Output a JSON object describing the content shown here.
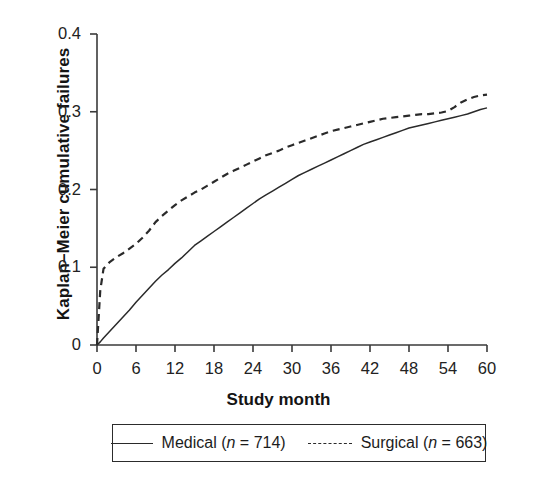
{
  "chart_data": {
    "type": "line",
    "title": "",
    "xlabel": "Study month",
    "ylabel": "Kaplan–Meier cumulative failures",
    "xlim": [
      0,
      60
    ],
    "ylim": [
      0,
      0.4
    ],
    "xticks": [
      "0",
      "6",
      "12",
      "18",
      "24",
      "30",
      "36",
      "42",
      "48",
      "54",
      "60"
    ],
    "yticks": [
      "0",
      "0.1",
      "0.2",
      "0.3",
      "0.4"
    ],
    "xtick_values": [
      0,
      6,
      12,
      18,
      24,
      30,
      36,
      42,
      48,
      54,
      60
    ],
    "ytick_values": [
      0,
      0.1,
      0.2,
      0.3,
      0.4
    ],
    "grid": false,
    "legend_position": "below-axis",
    "x": [
      0,
      0.5,
      1,
      2,
      3,
      4,
      5,
      6,
      7,
      8,
      9,
      10,
      11,
      12,
      13,
      14,
      15,
      16,
      17,
      18,
      19,
      20,
      21,
      22,
      23,
      24,
      25,
      26,
      27,
      28,
      29,
      30,
      31,
      32,
      33,
      34,
      35,
      36,
      37,
      38,
      39,
      40,
      41,
      42,
      43,
      44,
      45,
      46,
      47,
      48,
      49,
      50,
      51,
      52,
      53,
      54,
      55,
      56,
      57,
      58,
      59,
      60
    ],
    "series": [
      {
        "name": "Medical (n = 714)",
        "label_plain": "Medical",
        "n": 714,
        "style": "solid",
        "color": "#2a2a2a",
        "values": [
          0,
          0.004,
          0.009,
          0.018,
          0.027,
          0.036,
          0.045,
          0.055,
          0.064,
          0.073,
          0.082,
          0.09,
          0.097,
          0.105,
          0.112,
          0.12,
          0.128,
          0.134,
          0.14,
          0.146,
          0.152,
          0.158,
          0.164,
          0.17,
          0.176,
          0.182,
          0.188,
          0.193,
          0.198,
          0.203,
          0.208,
          0.213,
          0.218,
          0.222,
          0.226,
          0.23,
          0.234,
          0.238,
          0.242,
          0.246,
          0.25,
          0.254,
          0.258,
          0.261,
          0.264,
          0.267,
          0.27,
          0.273,
          0.276,
          0.279,
          0.281,
          0.283,
          0.285,
          0.287,
          0.289,
          0.291,
          0.293,
          0.295,
          0.297,
          0.3,
          0.303,
          0.305
        ]
      },
      {
        "name": "Surgical (n = 663)",
        "label_plain": "Surgical",
        "n": 663,
        "style": "dashed",
        "color": "#2a2a2a",
        "values": [
          0,
          0.07,
          0.098,
          0.107,
          0.113,
          0.118,
          0.124,
          0.13,
          0.138,
          0.147,
          0.158,
          0.166,
          0.173,
          0.18,
          0.186,
          0.191,
          0.196,
          0.2,
          0.205,
          0.21,
          0.215,
          0.22,
          0.224,
          0.228,
          0.232,
          0.236,
          0.24,
          0.244,
          0.247,
          0.25,
          0.254,
          0.257,
          0.26,
          0.263,
          0.266,
          0.269,
          0.272,
          0.275,
          0.277,
          0.279,
          0.281,
          0.283,
          0.285,
          0.287,
          0.289,
          0.291,
          0.292,
          0.293,
          0.294,
          0.295,
          0.296,
          0.297,
          0.297,
          0.298,
          0.299,
          0.301,
          0.306,
          0.312,
          0.316,
          0.319,
          0.321,
          0.322
        ]
      }
    ]
  },
  "legend": {
    "medical_label": "Medical (",
    "medical_n_italic": "n",
    "medical_n_value": " = 714)",
    "surgical_label": "Surgical (",
    "surgical_n_italic": "n",
    "surgical_n_value": " = 663)"
  },
  "axes": {
    "x_title": "Study month",
    "y_title": "Kaplan–Meier cumulative failures"
  }
}
